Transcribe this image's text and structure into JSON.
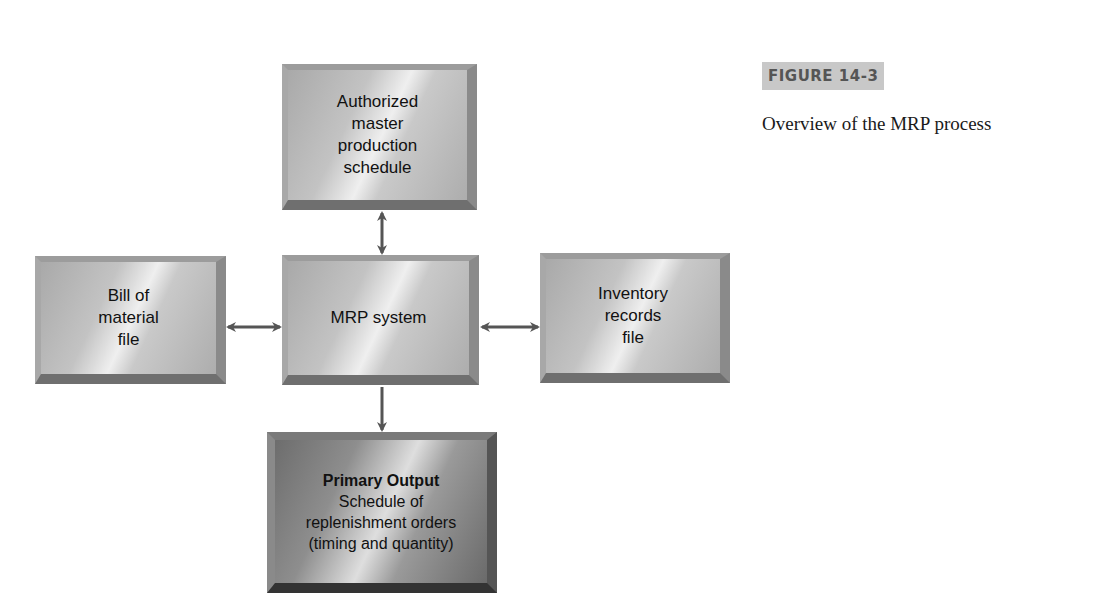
{
  "figure": {
    "label": "FIGURE 14-3",
    "caption": "Overview of the MRP process"
  },
  "diagram": {
    "boxes": {
      "master_schedule": {
        "lines": [
          "Authorized",
          "master",
          "production",
          "schedule"
        ]
      },
      "bill_of_material": {
        "lines": [
          "Bill of",
          "material",
          "file"
        ]
      },
      "mrp_system": {
        "lines": [
          "MRP system"
        ]
      },
      "inventory_records": {
        "lines": [
          "Inventory",
          "records",
          "file"
        ]
      },
      "primary_output": {
        "title": "Primary Output",
        "lines": [
          "Schedule of",
          "replenishment orders",
          "(timing and quantity)"
        ]
      }
    },
    "connections": [
      {
        "from": "master_schedule",
        "to": "mrp_system",
        "type": "bidirectional"
      },
      {
        "from": "bill_of_material",
        "to": "mrp_system",
        "type": "bidirectional"
      },
      {
        "from": "mrp_system",
        "to": "inventory_records",
        "type": "bidirectional"
      },
      {
        "from": "mrp_system",
        "to": "primary_output",
        "type": "directed"
      }
    ],
    "colors": {
      "arrow": "#555555",
      "box_light": "#c3c3c3",
      "box_dark": "#8e8e8e",
      "figure_label_bg": "#c8c8c8"
    }
  }
}
